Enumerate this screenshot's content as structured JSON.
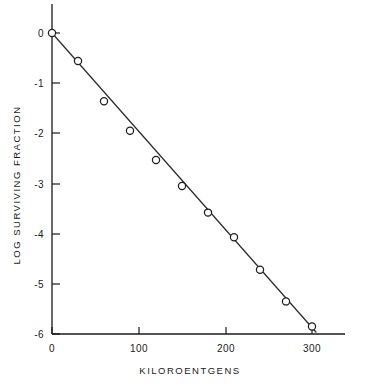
{
  "chart_data": {
    "type": "scatter",
    "title": "",
    "xlabel": "KILOROENTGENS",
    "ylabel": "LOG SURVIVING FRACTION",
    "xlim": [
      0,
      310
    ],
    "ylim": [
      -6,
      0.35
    ],
    "grid": false,
    "legend": null,
    "marker_style": "open-circle",
    "has_fit_line": true,
    "x_ticks": [
      0,
      100,
      200,
      300
    ],
    "x_tick_labels": [
      "0",
      "100",
      "200",
      "300"
    ],
    "y_ticks": [
      0,
      -1,
      -2,
      -3,
      -4,
      -5,
      -6
    ],
    "y_tick_labels": [
      "0",
      "-1",
      "-2",
      "-3",
      "-4",
      "-5",
      "-6"
    ],
    "x": [
      0,
      30,
      60,
      90,
      120,
      150,
      180,
      210,
      240,
      270,
      300
    ],
    "values": [
      0,
      -0.56,
      -1.36,
      -1.95,
      -2.53,
      -3.05,
      -3.58,
      -4.07,
      -4.72,
      -5.35,
      -5.85
    ],
    "series": [
      {
        "name": "Surviving fraction",
        "x": [
          0,
          30,
          60,
          90,
          120,
          150,
          180,
          210,
          240,
          270,
          300
        ],
        "values": [
          0,
          -0.56,
          -1.36,
          -1.95,
          -2.53,
          -3.05,
          -3.58,
          -4.07,
          -4.72,
          -5.35,
          -5.85
        ]
      }
    ],
    "fit_line": {
      "x_start": 0,
      "y_start": 0,
      "x_end": 305,
      "y_end": -5.97,
      "slope": -0.01957,
      "intercept": 0
    },
    "colors": {
      "axis": "#1a1a1a",
      "line": "#2a2a2a",
      "marker_stroke": "#1d1d1d",
      "marker_fill": "#ffffff",
      "background": "#ffffff"
    }
  }
}
